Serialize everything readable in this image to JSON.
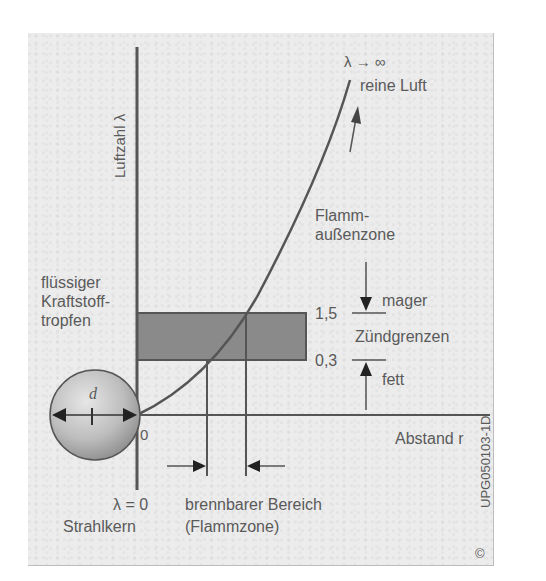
{
  "figure": {
    "y_axis_label": "Luftzahl λ",
    "x_axis_label": "Abstand r",
    "origin_label": "0",
    "top_label_lambda": "λ → ∞",
    "top_label_text": "reine Luft",
    "outer_zone_line1": "Flamm-",
    "outer_zone_line2": "außenzone",
    "droplet_line1": "flüssiger",
    "droplet_line2": "Kraftstoff-",
    "droplet_line3": "tropfen",
    "droplet_diameter": "d",
    "limit_upper_value": "1,5",
    "limit_lower_value": "0,3",
    "limit_upper_label": "mager",
    "limit_lower_label": "fett",
    "limit_band_label": "Zündgrenzen",
    "core_lambda": "λ = 0",
    "core_label": "Strahlkern",
    "burn_range_line1": "brennbarer Bereich",
    "burn_range_line2": "(Flammzone)",
    "figure_code": "UPG050103-1D",
    "copyright_mark": "©"
  },
  "colors": {
    "panel_bg": "#ececec",
    "line": "#555555",
    "band_fill": "#8a8a8a",
    "text": "#5a5a5a",
    "droplet_light": "#d8d8d8",
    "droplet_dark": "#8f8f8f"
  }
}
